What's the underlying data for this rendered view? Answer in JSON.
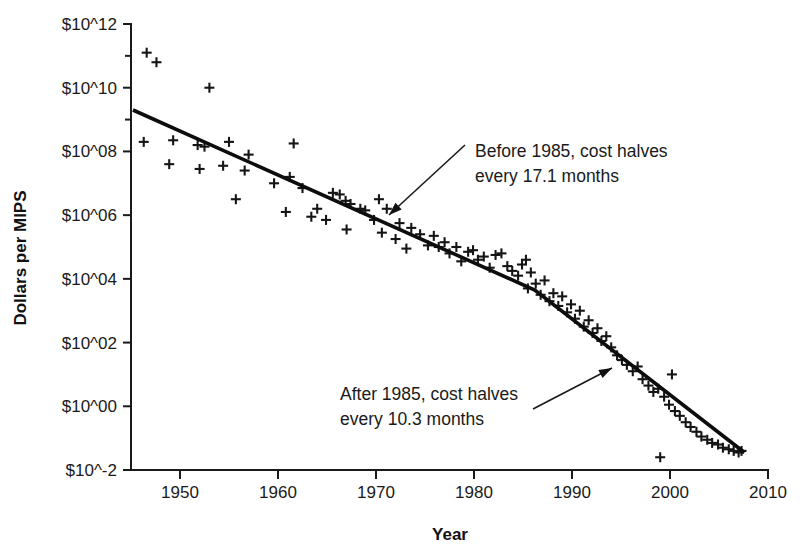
{
  "chart_data": {
    "type": "scatter",
    "title": "",
    "xlabel": "Year",
    "ylabel": "Dollars per MIPS",
    "xlim": [
      1945,
      2010
    ],
    "ylim": [
      -2,
      12
    ],
    "y_scale": "log10-exponent",
    "grid": false,
    "legend": null,
    "xticks": [
      1950,
      1960,
      1970,
      1980,
      1990,
      2000,
      2010
    ],
    "xtick_labels": [
      "1950",
      "1960",
      "1970",
      "1980",
      "1990",
      "2000",
      "2010"
    ],
    "yticks": [
      12,
      10,
      8,
      6,
      4,
      2,
      0,
      -2
    ],
    "ytick_labels": [
      "$10^12",
      "$10^10",
      "$10^08",
      "$10^06",
      "$10^04",
      "$10^02",
      "$10^00",
      "$10^-2"
    ],
    "y_minor_ticks": [
      11,
      9
    ],
    "marker_symbol": "plus",
    "series": [
      {
        "name": "Cost per MIPS",
        "points": [
          [
            1946.6,
            11.1
          ],
          [
            1947.6,
            10.8
          ],
          [
            1946.3,
            8.3
          ],
          [
            1949.3,
            8.35
          ],
          [
            1948.9,
            7.6
          ],
          [
            1951.8,
            8.2
          ],
          [
            1952.5,
            8.15
          ],
          [
            1953.0,
            10.0
          ],
          [
            1952.0,
            7.45
          ],
          [
            1955.0,
            8.3
          ],
          [
            1955.7,
            6.5
          ],
          [
            1954.4,
            7.55
          ],
          [
            1957.0,
            7.9
          ],
          [
            1956.6,
            7.4
          ],
          [
            1959.6,
            7.0
          ],
          [
            1960.8,
            6.1
          ],
          [
            1961.6,
            8.25
          ],
          [
            1961.2,
            7.2
          ],
          [
            1962.5,
            6.85
          ],
          [
            1964.0,
            6.2
          ],
          [
            1963.4,
            5.95
          ],
          [
            1964.9,
            5.85
          ],
          [
            1965.6,
            6.7
          ],
          [
            1966.3,
            6.65
          ],
          [
            1966.9,
            6.45
          ],
          [
            1967.4,
            6.35
          ],
          [
            1967.0,
            5.55
          ],
          [
            1968.4,
            6.2
          ],
          [
            1968.9,
            6.15
          ],
          [
            1970.3,
            6.5
          ],
          [
            1969.8,
            5.85
          ],
          [
            1971.1,
            6.2
          ],
          [
            1970.6,
            5.45
          ],
          [
            1972.4,
            5.75
          ],
          [
            1972.0,
            5.25
          ],
          [
            1973.6,
            5.6
          ],
          [
            1973.1,
            4.95
          ],
          [
            1974.5,
            5.4
          ],
          [
            1975.3,
            5.05
          ],
          [
            1975.9,
            5.35
          ],
          [
            1976.4,
            5.0
          ],
          [
            1977.0,
            5.15
          ],
          [
            1977.5,
            4.8
          ],
          [
            1978.2,
            5.0
          ],
          [
            1978.7,
            4.55
          ],
          [
            1979.4,
            4.85
          ],
          [
            1979.9,
            4.9
          ],
          [
            1980.4,
            4.6
          ],
          [
            1981.0,
            4.7
          ],
          [
            1981.6,
            4.35
          ],
          [
            1982.2,
            4.75
          ],
          [
            1982.8,
            4.8
          ],
          [
            1983.4,
            4.4
          ],
          [
            1983.9,
            4.25
          ],
          [
            1984.5,
            4.1
          ],
          [
            1984.9,
            4.45
          ],
          [
            1985.3,
            4.6
          ],
          [
            1985.8,
            4.2
          ],
          [
            1985.5,
            3.7
          ],
          [
            1986.3,
            3.85
          ],
          [
            1986.8,
            3.5
          ],
          [
            1987.2,
            3.95
          ],
          [
            1987.7,
            3.3
          ],
          [
            1988.1,
            3.55
          ],
          [
            1988.6,
            3.15
          ],
          [
            1989.0,
            3.45
          ],
          [
            1989.5,
            2.95
          ],
          [
            1989.9,
            3.2
          ],
          [
            1990.3,
            2.75
          ],
          [
            1990.8,
            3.0
          ],
          [
            1991.2,
            2.5
          ],
          [
            1991.7,
            2.7
          ],
          [
            1992.1,
            2.3
          ],
          [
            1992.6,
            2.45
          ],
          [
            1993.0,
            2.05
          ],
          [
            1993.5,
            2.2
          ],
          [
            1994.0,
            1.85
          ],
          [
            1994.6,
            1.6
          ],
          [
            1995.1,
            1.45
          ],
          [
            1995.6,
            1.3
          ],
          [
            1996.2,
            1.1
          ],
          [
            1996.7,
            1.25
          ],
          [
            1997.2,
            0.85
          ],
          [
            1997.8,
            0.65
          ],
          [
            1998.3,
            0.45
          ],
          [
            1998.8,
            0.55
          ],
          [
            1999.4,
            0.3
          ],
          [
            1999.9,
            0.05
          ],
          [
            2000.5,
            -0.15
          ],
          [
            2000.2,
            1.0
          ],
          [
            2001.0,
            -0.3
          ],
          [
            2001.6,
            -0.5
          ],
          [
            2002.1,
            -0.65
          ],
          [
            2002.7,
            -0.8
          ],
          [
            2003.2,
            -0.95
          ],
          [
            2003.8,
            -1.05
          ],
          [
            2004.3,
            -1.15
          ],
          [
            2004.9,
            -1.2
          ],
          [
            2005.4,
            -1.3
          ],
          [
            2006.0,
            -1.35
          ],
          [
            2006.5,
            -1.4
          ],
          [
            2007.0,
            -1.45
          ],
          [
            2007.3,
            -1.4
          ],
          [
            1999.0,
            -1.6
          ]
        ]
      }
    ],
    "trend_line": {
      "name": "fitted cost trend",
      "breakpoint_year": 1986.2,
      "vertices": [
        [
          1945.2,
          9.3
        ],
        [
          1986.2,
          3.65
        ],
        [
          2007.6,
          -1.45
        ]
      ]
    },
    "annotations": [
      {
        "id": "before-1985",
        "lines": [
          "Before 1985, cost halves",
          "every 17.1 months"
        ],
        "text_x": 475,
        "text_y": 157,
        "leader": {
          "x1": 465,
          "y1": 145,
          "x2": 389,
          "y2": 215
        },
        "arrow_angle_deg": 222
      },
      {
        "id": "after-1985",
        "lines": [
          "After 1985, cost halves",
          "every 10.3 months"
        ],
        "text_x": 340,
        "text_y": 400,
        "leader": {
          "x1": 533,
          "y1": 409,
          "x2": 612,
          "y2": 368
        },
        "arrow_angle_deg": 333
      }
    ]
  },
  "colors": {
    "ink": "#1a1a1a",
    "marker": "#151515",
    "trend": "#0d0d0d",
    "background": "#ffffff"
  }
}
